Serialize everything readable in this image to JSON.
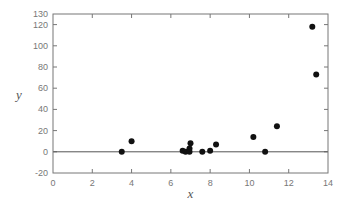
{
  "chart_data": {
    "type": "scatter",
    "title": "",
    "xlabel": "x",
    "ylabel": "y",
    "xlim": [
      0,
      14
    ],
    "ylim": [
      -20,
      130
    ],
    "x_ticks": [
      0,
      2,
      4,
      6,
      8,
      10,
      12,
      14
    ],
    "y_ticks": [
      -20,
      0,
      20,
      40,
      60,
      80,
      100,
      120,
      130
    ],
    "x_tick_labels": [
      "0",
      "2",
      "4",
      "6",
      "8",
      "10",
      "12",
      "14"
    ],
    "y_tick_labels": [
      "-20",
      "0",
      "20",
      "40",
      "60",
      "80",
      "100",
      "120",
      "130"
    ],
    "grid": false,
    "legend": null,
    "reference_line": {
      "y": 0
    },
    "series": [
      {
        "name": "data",
        "points": [
          {
            "x": 3.5,
            "y": 0
          },
          {
            "x": 4.0,
            "y": 10
          },
          {
            "x": 6.6,
            "y": 1
          },
          {
            "x": 6.75,
            "y": 0
          },
          {
            "x": 6.95,
            "y": 0
          },
          {
            "x": 6.95,
            "y": 3
          },
          {
            "x": 7.0,
            "y": 8
          },
          {
            "x": 7.6,
            "y": 0
          },
          {
            "x": 8.0,
            "y": 1
          },
          {
            "x": 8.3,
            "y": 7
          },
          {
            "x": 10.2,
            "y": 14
          },
          {
            "x": 10.8,
            "y": 0
          },
          {
            "x": 11.4,
            "y": 24
          },
          {
            "x": 13.2,
            "y": 118
          },
          {
            "x": 13.4,
            "y": 73
          }
        ]
      }
    ]
  }
}
